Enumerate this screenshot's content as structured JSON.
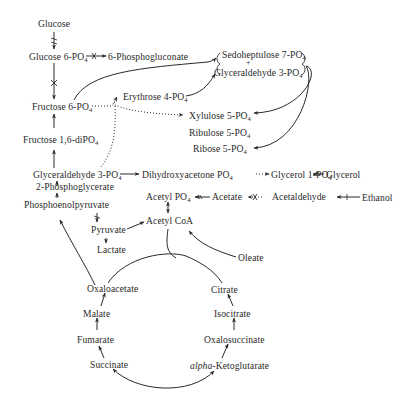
{
  "diagram": {
    "type": "metabolic-pathway-map",
    "nodes": {
      "glucose": {
        "label": "Glucose"
      },
      "glucose6p": {
        "label": "Glucose 6-PO",
        "sub": "4"
      },
      "phosphogluconate": {
        "label": "6-Phosphogluconate"
      },
      "sedoheptulose": {
        "label": "Sedoheptulose 7-PO",
        "sub": "4"
      },
      "plus": {
        "label": "+"
      },
      "glyceraldehyde3p_top": {
        "label": "Glyceraldehyde 3-PO",
        "sub": "4"
      },
      "erythrose": {
        "label": "Erythrose 4-PO",
        "sub": "4"
      },
      "fructose6p": {
        "label": "Fructose 6-PO",
        "sub": "4"
      },
      "xylulose": {
        "label": "Xylulose 5-PO",
        "sub": "4"
      },
      "ribulose": {
        "label": "Ribulose 5-PO",
        "sub": "4"
      },
      "ribose": {
        "label": "Ribose 5-PO",
        "sub": "4"
      },
      "fructose16": {
        "label": "Fructose 1,6-diPO",
        "sub": "4"
      },
      "glyceraldehyde3p": {
        "label": "Glyceraldehyde 3-PO",
        "sub": "4"
      },
      "dhap": {
        "label": "Dihydroxyacetone PO",
        "sub": "4"
      },
      "glycerol1p": {
        "label": "Glycerol 1-PO",
        "sub": "4"
      },
      "glycerol": {
        "label": "Glycerol"
      },
      "pg2": {
        "label": "2-Phosphoglycerate"
      },
      "pep": {
        "label": "Phosphoenolpyruvate"
      },
      "acetylpo4": {
        "label": "Acetyl PO",
        "sub": "4"
      },
      "acetate": {
        "label": "Acetate"
      },
      "acetaldehyde": {
        "label": "Acetaldehyde"
      },
      "ethanol": {
        "label": "Ethanol"
      },
      "pyruvate": {
        "label": "Pyruvate"
      },
      "acetylcoa": {
        "label": "Acetyl CoA"
      },
      "lactate": {
        "label": "Lactate"
      },
      "oleate": {
        "label": "Oleate"
      },
      "oxaloacetate": {
        "label": "Oxaloacetate"
      },
      "citrate": {
        "label": "Citrate"
      },
      "malate": {
        "label": "Malate"
      },
      "isocitrate": {
        "label": "Isocitrate"
      },
      "fumarate": {
        "label": "Fumarate"
      },
      "oxalosuccinate": {
        "label": "Oxalosuccinate"
      },
      "succinate": {
        "label": "Succinate"
      },
      "akg_prefix": {
        "label": "alpha"
      },
      "akg": {
        "label": "-Ketoglutarate"
      }
    },
    "colors": {
      "line": "#2a2a2a",
      "text": "#2a2a2a",
      "background": "#ffffff"
    }
  }
}
